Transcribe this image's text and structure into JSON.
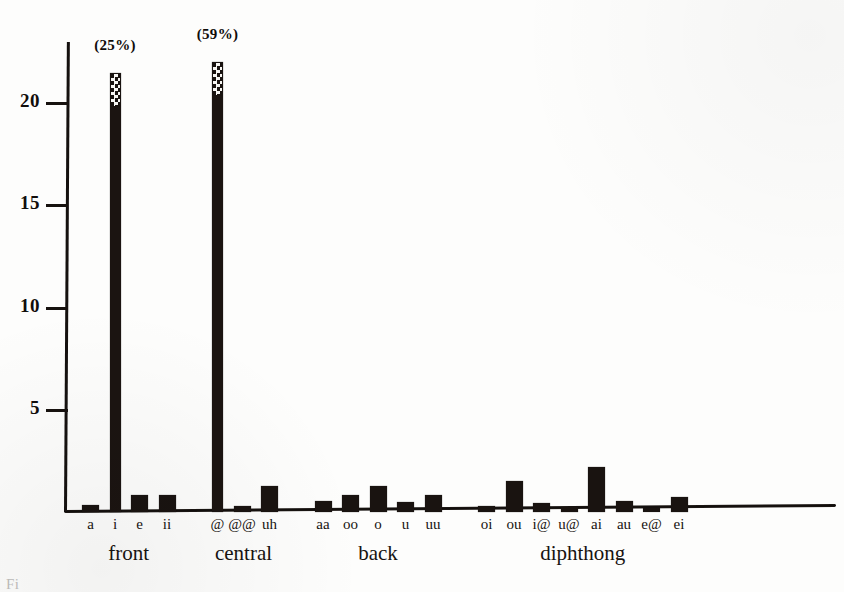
{
  "chart_data": {
    "type": "bar",
    "title": "",
    "xlabel": "",
    "ylabel": "",
    "ylim": [
      0,
      23
    ],
    "grid": false,
    "legend": "none",
    "y_ticks": [
      5,
      10,
      15,
      20
    ],
    "categories": [
      "a",
      "i",
      "e",
      "ii",
      "@",
      "@@",
      "uh",
      "aa",
      "oo",
      "o",
      "u",
      "uu",
      "oi",
      "ou",
      "i@",
      "u@",
      "ai",
      "au",
      "e@",
      "ei"
    ],
    "values": [
      0.35,
      21.5,
      0.85,
      0.85,
      22.0,
      0.3,
      1.25,
      0.55,
      0.85,
      1.25,
      0.5,
      0.85,
      0.3,
      1.5,
      0.45,
      0.25,
      2.2,
      0.55,
      0.2,
      0.75
    ],
    "annotations": [
      {
        "category": "i",
        "text": "(25%)"
      },
      {
        "category": "@",
        "text": "(59%)"
      }
    ],
    "groups": [
      {
        "label": "front",
        "categories": [
          "a",
          "i",
          "e",
          "ii"
        ]
      },
      {
        "label": "central",
        "categories": [
          "@",
          "@@",
          "uh"
        ]
      },
      {
        "label": "back",
        "categories": [
          "aa",
          "oo",
          "o",
          "u",
          "uu"
        ]
      },
      {
        "label": "diphthong",
        "categories": [
          "oi",
          "ou",
          "i@",
          "u@",
          "ai",
          "au",
          "e@",
          "ei"
        ]
      }
    ]
  },
  "figure": {
    "caption_fragment": "Fi"
  },
  "colors": {
    "ink": "#191310",
    "paper": "#fdfdfc"
  }
}
